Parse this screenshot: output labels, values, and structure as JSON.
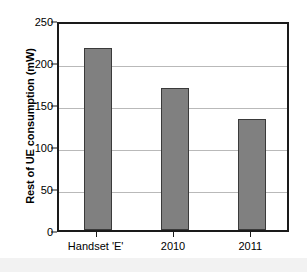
{
  "chart_data": {
    "type": "bar",
    "title": "",
    "subtitle": "",
    "categories": [
      "Handset 'E'",
      "2010",
      "2011"
    ],
    "values": [
      217,
      169,
      132
    ],
    "xlabel": "",
    "ylabel": "Rest of UE consumption (mW)",
    "ylim": [
      0,
      250
    ],
    "yticks": [
      0,
      50,
      100,
      150,
      200,
      250
    ],
    "ytick_labels": [
      "0",
      "50",
      "100",
      "150",
      "200",
      "250"
    ],
    "grid": "horizontal",
    "legend": "none",
    "bar_color": "#808080",
    "bar_edge_color": "#3a3a3a",
    "gridline_color": "#b9b9b9",
    "frame_color": "#1a1a1a",
    "background_color": "#ffffff",
    "annotations": []
  }
}
